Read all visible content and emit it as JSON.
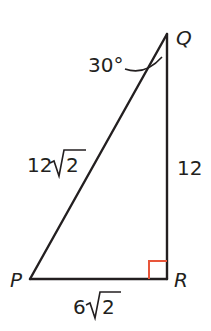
{
  "diagram": {
    "type": "right-triangle",
    "vertices": {
      "P": {
        "label": "P",
        "x": 30,
        "y": 279
      },
      "Q": {
        "label": "Q",
        "x": 167,
        "y": 34
      },
      "R": {
        "label": "R",
        "x": 167,
        "y": 279
      }
    },
    "sides": {
      "PQ": {
        "label_num": "12",
        "label_rad": "2",
        "text": "12√2"
      },
      "QR": {
        "label": "12"
      },
      "PR": {
        "label_num": "6",
        "label_rad": "2",
        "text": "6√2"
      }
    },
    "angles": {
      "Q": {
        "label": "30°"
      },
      "R": {
        "right_angle": true
      }
    },
    "colors": {
      "stroke": "#231f20",
      "right_angle_marker": "#e8553a"
    }
  }
}
